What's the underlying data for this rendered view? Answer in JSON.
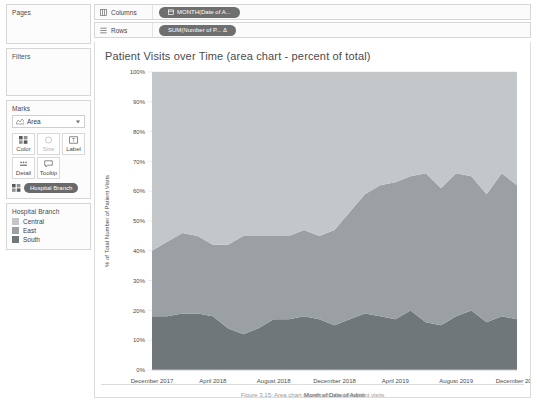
{
  "shelves": {
    "columns": {
      "label": "Columns",
      "icon": "columns-grid-icon",
      "pill": "MONTH(Date of A..."
    },
    "rows": {
      "label": "Rows",
      "icon": "rows-list-icon",
      "pill": "SUM(Number of P... Δ"
    }
  },
  "cards": {
    "pages": {
      "title": "Pages"
    },
    "filters": {
      "title": "Filters"
    },
    "marks": {
      "title": "Marks",
      "mark_type": "Area",
      "buttons": [
        {
          "label": "Color",
          "icon": "color-palette-icon",
          "enabled": true
        },
        {
          "label": "Size",
          "icon": "size-circle-icon",
          "enabled": false
        },
        {
          "label": "Label",
          "icon": "label-text-icon",
          "enabled": true
        },
        {
          "label": "Detail",
          "icon": "detail-dots-icon",
          "enabled": true
        },
        {
          "label": "Tooltip",
          "icon": "tooltip-bubble-icon",
          "enabled": true
        }
      ],
      "encoding_pill": {
        "icon": "color-palette-icon",
        "label": "Hospital Branch"
      }
    },
    "legend": {
      "title": "Hospital Branch",
      "items": [
        {
          "label": "Central",
          "color": "#c3c7c9"
        },
        {
          "label": "East",
          "color": "#9aa0a3"
        },
        {
          "label": "South",
          "color": "#70777b"
        }
      ]
    }
  },
  "viz": {
    "title": "Patient Visits over Time (area chart - percent of total)",
    "caption": "Figure 3.15: Area chart of percent of total patient visits"
  },
  "chart_data": {
    "type": "area",
    "stacked": true,
    "percent_of_total": true,
    "title": "Patient Visits over Time (area chart - percent of total)",
    "xlabel": "Month of Date of Admit",
    "ylabel": "% of Total Number of Patient Visits",
    "ylim": [
      0,
      100
    ],
    "ytick_labels": [
      "0%",
      "10%",
      "20%",
      "30%",
      "40%",
      "50%",
      "60%",
      "70%",
      "80%",
      "90%",
      "100%"
    ],
    "yticks": [
      0,
      10,
      20,
      30,
      40,
      50,
      60,
      70,
      80,
      90,
      100
    ],
    "grid": true,
    "legend_position": "left-panel",
    "xtick_labels": [
      "December 2017",
      "April 2018",
      "August 2018",
      "December 2018",
      "April 2019",
      "August 2019",
      "December 2019"
    ],
    "xticks": [
      0,
      4,
      8,
      12,
      16,
      20,
      24
    ],
    "x": [
      "December 2017",
      "January 2018",
      "February 2018",
      "March 2018",
      "April 2018",
      "May 2018",
      "June 2018",
      "July 2018",
      "August 2018",
      "September 2018",
      "October 2018",
      "November 2018",
      "December 2018",
      "January 2019",
      "February 2019",
      "March 2019",
      "April 2019",
      "May 2019",
      "June 2019",
      "July 2019",
      "August 2019",
      "September 2019",
      "October 2019",
      "November 2019",
      "December 2019"
    ],
    "series": [
      {
        "name": "South",
        "color": "#70777b",
        "values": [
          18,
          18,
          19,
          19,
          18,
          14,
          12,
          14,
          17,
          17,
          18,
          17,
          15,
          17,
          19,
          18,
          17,
          20,
          16,
          15,
          18,
          20,
          16,
          18,
          17
        ]
      },
      {
        "name": "East",
        "color": "#9aa0a3",
        "values": [
          22,
          25,
          27,
          26,
          24,
          28,
          33,
          31,
          28,
          28,
          29,
          28,
          32,
          36,
          40,
          44,
          46,
          45,
          50,
          46,
          48,
          45,
          43,
          48,
          45
        ]
      },
      {
        "name": "Central",
        "color": "#c3c7c9",
        "values": [
          60,
          57,
          54,
          55,
          58,
          58,
          55,
          55,
          55,
          55,
          53,
          55,
          53,
          47,
          41,
          38,
          37,
          35,
          34,
          39,
          34,
          35,
          41,
          34,
          38
        ]
      }
    ]
  }
}
